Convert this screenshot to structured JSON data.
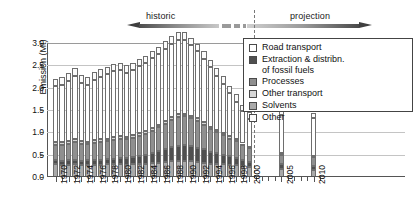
{
  "header": {
    "historic_label": "historic",
    "projection_label": "projection"
  },
  "legend": {
    "items": [
      {
        "label": "Road transport",
        "color": "#ffffff"
      },
      {
        "label": "Extraction & distribn.\nof fossil fuels",
        "color": "#4f4f4f"
      },
      {
        "label": "Processes",
        "color": "#8f8f8f"
      },
      {
        "label": "Other transport",
        "color": "#d6d6d6"
      },
      {
        "label": "Solvents",
        "color": "#a9a9a9"
      },
      {
        "label": "Other",
        "color": "#fcfcfc"
      }
    ]
  },
  "chart_data": {
    "type": "bar",
    "title": "",
    "xlabel": "",
    "ylabel": "Emission (Mt)",
    "ylim": [
      0.0,
      3.0
    ],
    "ytick_labels": [
      "0.0",
      "0.5",
      "1.0",
      "1.5",
      "2.0",
      "2.5",
      "3.0"
    ],
    "ytick_values": [
      0.0,
      0.5,
      1.0,
      1.5,
      2.0,
      2.5,
      3.0
    ],
    "grid": true,
    "stacked": true,
    "legend_position": "top-right",
    "series_order": [
      "Solvents",
      "Extraction & distribn. of fossil fuels",
      "Processes",
      "Other transport",
      "Road transport",
      "Other"
    ],
    "series_colors": [
      "#a9a9a9",
      "#4f4f4f",
      "#8f8f8f",
      "#d6d6d6",
      "#ffffff",
      "#fcfcfc"
    ],
    "categories": [
      1970,
      1971,
      1972,
      1973,
      1974,
      1975,
      1976,
      1977,
      1978,
      1979,
      1980,
      1981,
      1982,
      1983,
      1984,
      1985,
      1986,
      1987,
      1988,
      1989,
      1990,
      1991,
      1992,
      1993,
      1994,
      1995,
      1996,
      1997,
      1998,
      1999,
      2000,
      2005,
      2010
    ],
    "xtick_labels": [
      "1970",
      "1972",
      "1974",
      "1976",
      "1978",
      "1980",
      "1982",
      "1984",
      "1986",
      "1988",
      "1990",
      "1992",
      "1994",
      "1996",
      "1998",
      "2000",
      "2005",
      "2010"
    ],
    "series": [
      {
        "name": "Solvents",
        "values": [
          0.28,
          0.27,
          0.27,
          0.28,
          0.26,
          0.26,
          0.27,
          0.27,
          0.28,
          0.28,
          0.28,
          0.27,
          0.28,
          0.29,
          0.3,
          0.31,
          0.32,
          0.33,
          0.35,
          0.36,
          0.36,
          0.35,
          0.34,
          0.32,
          0.3,
          0.29,
          0.28,
          0.27,
          0.26,
          0.24,
          0.22,
          0.18,
          0.16
        ]
      },
      {
        "name": "Extraction & distribn. of fossil fuels",
        "values": [
          0.09,
          0.09,
          0.1,
          0.1,
          0.1,
          0.11,
          0.11,
          0.12,
          0.12,
          0.13,
          0.14,
          0.15,
          0.16,
          0.18,
          0.2,
          0.23,
          0.26,
          0.29,
          0.32,
          0.34,
          0.35,
          0.34,
          0.32,
          0.3,
          0.27,
          0.24,
          0.22,
          0.19,
          0.17,
          0.14,
          0.12,
          0.1,
          0.09
        ]
      },
      {
        "name": "Processes",
        "values": [
          0.35,
          0.36,
          0.37,
          0.4,
          0.38,
          0.36,
          0.38,
          0.39,
          0.4,
          0.42,
          0.43,
          0.42,
          0.43,
          0.45,
          0.47,
          0.5,
          0.53,
          0.57,
          0.61,
          0.64,
          0.65,
          0.62,
          0.59,
          0.55,
          0.51,
          0.47,
          0.44,
          0.4,
          0.37,
          0.33,
          0.3,
          0.22,
          0.2
        ]
      },
      {
        "name": "Other transport",
        "values": [
          0.06,
          0.06,
          0.06,
          0.06,
          0.06,
          0.06,
          0.06,
          0.06,
          0.06,
          0.06,
          0.06,
          0.06,
          0.06,
          0.06,
          0.06,
          0.06,
          0.06,
          0.06,
          0.06,
          0.06,
          0.06,
          0.06,
          0.06,
          0.06,
          0.05,
          0.05,
          0.05,
          0.05,
          0.05,
          0.04,
          0.04,
          0.04,
          0.03
        ]
      },
      {
        "name": "Road transport",
        "values": [
          1.25,
          1.28,
          1.35,
          1.42,
          1.31,
          1.28,
          1.36,
          1.4,
          1.44,
          1.48,
          1.48,
          1.43,
          1.46,
          1.5,
          1.52,
          1.56,
          1.58,
          1.62,
          1.64,
          1.67,
          1.65,
          1.58,
          1.5,
          1.42,
          1.33,
          1.22,
          1.1,
          0.97,
          0.84,
          0.72,
          0.62,
          0.85,
          0.83
        ]
      },
      {
        "name": "Other",
        "values": [
          0.17,
          0.17,
          0.17,
          0.17,
          0.17,
          0.17,
          0.17,
          0.17,
          0.17,
          0.17,
          0.17,
          0.17,
          0.17,
          0.17,
          0.17,
          0.17,
          0.17,
          0.17,
          0.17,
          0.17,
          0.17,
          0.17,
          0.17,
          0.17,
          0.17,
          0.17,
          0.17,
          0.16,
          0.16,
          0.15,
          0.15,
          0.13,
          0.13
        ]
      }
    ],
    "totals": [
      2.2,
      2.23,
      2.32,
      2.43,
      2.28,
      2.24,
      2.35,
      2.41,
      2.47,
      2.54,
      2.56,
      2.5,
      2.56,
      2.65,
      2.72,
      2.83,
      2.92,
      3.04,
      3.15,
      3.24,
      3.24,
      3.12,
      2.98,
      2.82,
      2.63,
      2.44,
      2.26,
      2.04,
      1.85,
      1.62,
      1.45,
      1.52,
      1.44
    ]
  }
}
